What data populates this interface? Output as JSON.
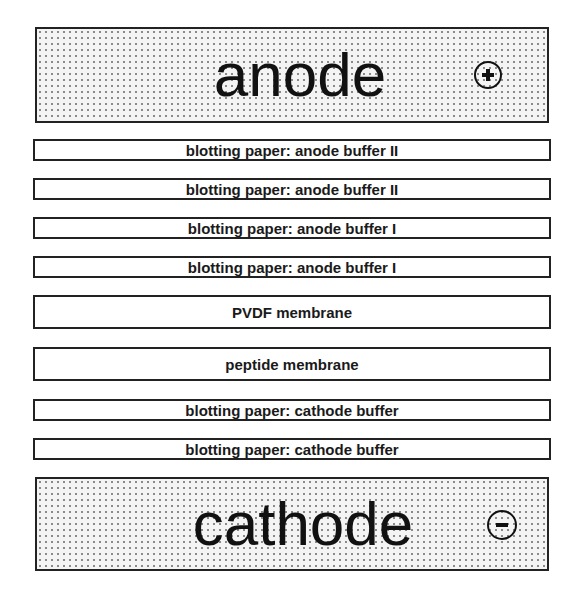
{
  "diagram": {
    "type": "blot-stack",
    "anode": {
      "label": "anode",
      "polarity": "plus-icon"
    },
    "layers": [
      {
        "label": "blotting paper: anode buffer II",
        "kind": "paper"
      },
      {
        "label": "blotting paper: anode buffer II",
        "kind": "paper"
      },
      {
        "label": "blotting paper: anode buffer I",
        "kind": "paper"
      },
      {
        "label": "blotting paper: anode buffer I",
        "kind": "paper"
      },
      {
        "label": "PVDF membrane",
        "kind": "membrane"
      },
      {
        "label": "peptide membrane",
        "kind": "membrane"
      },
      {
        "label": "blotting paper: cathode buffer",
        "kind": "paper"
      },
      {
        "label": "blotting paper: cathode buffer",
        "kind": "paper"
      }
    ],
    "cathode": {
      "label": "cathode",
      "polarity": "minus-icon"
    }
  },
  "colors": {
    "outline": "#222222",
    "electrode_fill": "#f4f4f4",
    "dots": "#8a8a8a"
  }
}
